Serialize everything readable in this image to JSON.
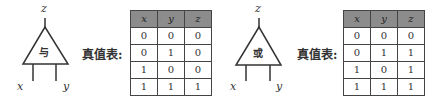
{
  "gates": [
    {
      "name": "and",
      "label": "与",
      "output": "z",
      "inputs": [
        "x",
        "y"
      ],
      "truth_table_label": "真值表:",
      "columns": [
        "x",
        "y",
        "z"
      ],
      "rows": [
        [
          "0",
          "0",
          "0"
        ],
        [
          "0",
          "1",
          "0"
        ],
        [
          "1",
          "0",
          "0"
        ],
        [
          "1",
          "1",
          "1"
        ]
      ]
    },
    {
      "name": "or",
      "label": "或",
      "output": "z",
      "inputs": [
        "x",
        "y"
      ],
      "truth_table_label": "真值表:",
      "columns": [
        "x",
        "y",
        "z"
      ],
      "rows": [
        [
          "0",
          "0",
          "0"
        ],
        [
          "0",
          "1",
          "1"
        ],
        [
          "1",
          "0",
          "1"
        ],
        [
          "1",
          "1",
          "1"
        ]
      ]
    }
  ],
  "colors": {
    "header_bg": "#8c8c8c",
    "line": "#333333"
  }
}
